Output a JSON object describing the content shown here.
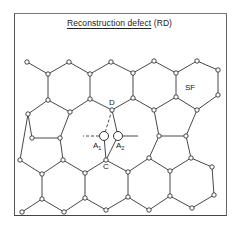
{
  "figure": {
    "title_main": "Reconstruction  defect",
    "title_abbrev": " (RD)"
  },
  "labels": {
    "sf": "SF",
    "d": "D",
    "c": "C",
    "a1": "A",
    "a1_sub": "1",
    "a2": "A",
    "a2_sub": "2"
  },
  "colors": {
    "line": "#333333",
    "node_fill": "#ffffff",
    "frame": "#555555"
  },
  "nodes": [
    {
      "id": "n1",
      "x": 27,
      "y": 62
    },
    {
      "id": "n2",
      "x": 48,
      "y": 74
    },
    {
      "id": "n3",
      "x": 69,
      "y": 62
    },
    {
      "id": "n4",
      "x": 90,
      "y": 74
    },
    {
      "id": "n5",
      "x": 111,
      "y": 62
    },
    {
      "id": "n6",
      "x": 133,
      "y": 73
    },
    {
      "id": "n7",
      "x": 154,
      "y": 61
    },
    {
      "id": "n8",
      "x": 176,
      "y": 73
    },
    {
      "id": "n9",
      "x": 197,
      "y": 61
    },
    {
      "id": "n10",
      "x": 218,
      "y": 70
    },
    {
      "id": "n11",
      "x": 218,
      "y": 95
    },
    {
      "id": "n12",
      "x": 197,
      "y": 110
    },
    {
      "id": "n13",
      "x": 176,
      "y": 97
    },
    {
      "id": "n14",
      "x": 154,
      "y": 110
    },
    {
      "id": "n15",
      "x": 133,
      "y": 98
    },
    {
      "id": "D",
      "x": 112,
      "y": 110
    },
    {
      "id": "n17",
      "x": 90,
      "y": 99
    },
    {
      "id": "n18",
      "x": 48,
      "y": 100
    },
    {
      "id": "n19",
      "x": 70,
      "y": 112
    },
    {
      "id": "n20",
      "x": 28,
      "y": 114
    },
    {
      "id": "n21",
      "x": 32,
      "y": 138
    },
    {
      "id": "n22",
      "x": 60,
      "y": 138
    },
    {
      "id": "n23",
      "x": 20,
      "y": 160
    },
    {
      "id": "n24",
      "x": 63,
      "y": 160
    },
    {
      "id": "n25",
      "x": 42,
      "y": 174
    },
    {
      "id": "n26",
      "x": 85,
      "y": 173
    },
    {
      "id": "C",
      "x": 106,
      "y": 160
    },
    {
      "id": "n28",
      "x": 42,
      "y": 199
    },
    {
      "id": "n29",
      "x": 22,
      "y": 212
    },
    {
      "id": "n30",
      "x": 64,
      "y": 212
    },
    {
      "id": "n31",
      "x": 85,
      "y": 198
    },
    {
      "id": "n32",
      "x": 106,
      "y": 210
    },
    {
      "id": "n33",
      "x": 128,
      "y": 172
    },
    {
      "id": "n34",
      "x": 128,
      "y": 197
    },
    {
      "id": "n35",
      "x": 149,
      "y": 158
    },
    {
      "id": "n36",
      "x": 159,
      "y": 136
    },
    {
      "id": "n37",
      "x": 186,
      "y": 136
    },
    {
      "id": "n38",
      "x": 191,
      "y": 158
    },
    {
      "id": "n39",
      "x": 170,
      "y": 171
    },
    {
      "id": "n40",
      "x": 212,
      "y": 167
    },
    {
      "id": "n41",
      "x": 170,
      "y": 196
    },
    {
      "id": "n42",
      "x": 214,
      "y": 195
    },
    {
      "id": "n43",
      "x": 149,
      "y": 210
    },
    {
      "id": "n44",
      "x": 192,
      "y": 208
    }
  ],
  "atoms": [
    {
      "id": "A1",
      "x": 104,
      "y": 136,
      "r": 4.5
    },
    {
      "id": "A2",
      "x": 118,
      "y": 136,
      "r": 4.5
    }
  ],
  "bonds": [
    [
      "n1",
      "n2"
    ],
    [
      "n2",
      "n3"
    ],
    [
      "n3",
      "n4"
    ],
    [
      "n4",
      "n5"
    ],
    [
      "n5",
      "n6"
    ],
    [
      "n6",
      "n7"
    ],
    [
      "n7",
      "n8"
    ],
    [
      "n8",
      "n9"
    ],
    [
      "n9",
      "n10"
    ],
    [
      "n10",
      "n11"
    ],
    [
      "n11",
      "n12"
    ],
    [
      "n12",
      "n13"
    ],
    [
      "n13",
      "n8"
    ],
    [
      "n2",
      "n18"
    ],
    [
      "n4",
      "n17"
    ],
    [
      "n6",
      "n15"
    ],
    [
      "n13",
      "n14"
    ],
    [
      "n14",
      "n15"
    ],
    [
      "n15",
      "D"
    ],
    [
      "D",
      "n17"
    ],
    [
      "n17",
      "n19"
    ],
    [
      "n19",
      "n18"
    ],
    [
      "n18",
      "n20"
    ],
    [
      "n20",
      "n21"
    ],
    [
      "n21",
      "n22"
    ],
    [
      "n22",
      "n19"
    ],
    [
      "n14",
      "n36"
    ],
    [
      "n36",
      "n37"
    ],
    [
      "n37",
      "n12"
    ],
    [
      "n20",
      "n23"
    ],
    [
      "n23",
      "n25"
    ],
    [
      "n25",
      "n24"
    ],
    [
      "n24",
      "n22"
    ],
    [
      "n24",
      "n26"
    ],
    [
      "n26",
      "C"
    ],
    [
      "n25",
      "n28"
    ],
    [
      "n28",
      "n29"
    ],
    [
      "n28",
      "n30"
    ],
    [
      "n30",
      "n31"
    ],
    [
      "n31",
      "n26"
    ],
    [
      "n31",
      "n32"
    ],
    [
      "n32",
      "n34"
    ],
    [
      "C",
      "n33"
    ],
    [
      "n33",
      "n35"
    ],
    [
      "n35",
      "n36"
    ],
    [
      "n33",
      "n34"
    ],
    [
      "n34",
      "n43"
    ],
    [
      "n43",
      "n41"
    ],
    [
      "n41",
      "n39"
    ],
    [
      "n39",
      "n35"
    ],
    [
      "n39",
      "n38"
    ],
    [
      "n38",
      "n37"
    ],
    [
      "n38",
      "n40"
    ],
    [
      "n40",
      "n42"
    ],
    [
      "n42",
      "n44"
    ],
    [
      "n44",
      "n41"
    ],
    [
      "D",
      "A2"
    ],
    [
      "A2",
      "C"
    ],
    [
      "A1",
      "C"
    ]
  ],
  "dashed_bonds": [
    [
      "D",
      "A1"
    ]
  ],
  "stubs": [
    {
      "from": "A1",
      "x2": 83,
      "y2": 136,
      "dashed": true
    },
    {
      "from": "A2",
      "x2": 138,
      "y2": 136,
      "dashed": false
    }
  ]
}
